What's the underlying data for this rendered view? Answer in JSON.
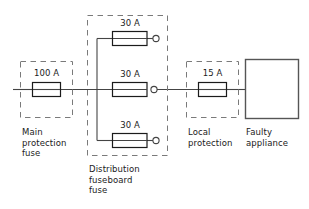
{
  "diagram": {
    "colors": {
      "wire": "#444444",
      "fuse_outline": "#1b1b1b",
      "dashed_box": "#6f6f6f",
      "appliance_outline": "#555555",
      "text": "#1b1b1b",
      "background": "#ffffff"
    },
    "fuses": {
      "main": {
        "rating": "100 A",
        "label": "Main\nprotection\nfuse"
      },
      "distribution": {
        "group_label": "Distribution\nfuseboard\nfuse",
        "ways": [
          {
            "rating": "30 A",
            "terminal": "open-circle",
            "position": "top"
          },
          {
            "rating": "30 A",
            "terminal": "open-circle",
            "position": "middle"
          },
          {
            "rating": "30 A",
            "terminal": "open-circle",
            "position": "bottom"
          }
        ]
      },
      "local": {
        "rating": "15 A",
        "label": "Local\nprotection"
      }
    },
    "appliance": {
      "label": "Faulty\nappliance"
    }
  }
}
